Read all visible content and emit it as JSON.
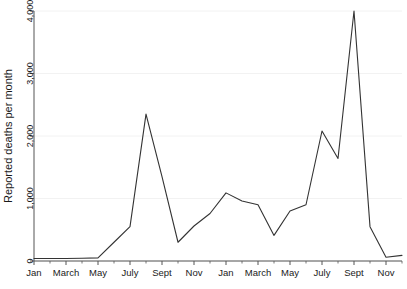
{
  "chart_data": {
    "type": "line",
    "title": "",
    "xlabel": "",
    "ylabel": "Reported deaths per month",
    "ylim": [
      0,
      4000
    ],
    "yticks": [
      0,
      1000,
      2000,
      3000,
      4000
    ],
    "ytick_labels": [
      "0",
      "1,000",
      "2,000",
      "3,000",
      "4,000"
    ],
    "grid": true,
    "grid_axis": "y",
    "legend": "none",
    "line_color": "#333333",
    "axis_color": "#555555",
    "grid_color": "#f2f2f2",
    "background_color": "#ffffff",
    "xtick_labels": [
      "Jan",
      "March",
      "May",
      "July",
      "Sept",
      "Nov",
      "Jan",
      "March",
      "May",
      "July",
      "Sept",
      "Nov"
    ],
    "xtick_indices": [
      0,
      2,
      4,
      6,
      8,
      10,
      12,
      14,
      16,
      18,
      20,
      22
    ],
    "x": [
      0,
      1,
      2,
      3,
      4,
      5,
      6,
      7,
      8,
      9,
      10,
      11,
      12,
      13,
      14,
      15,
      16,
      17,
      18,
      19,
      20,
      21,
      22,
      23
    ],
    "x_labels": [
      "Jan",
      "Feb",
      "March",
      "April",
      "May",
      "June",
      "July",
      "Aug",
      "Sept",
      "Oct",
      "Nov",
      "Dec",
      "Jan",
      "Feb",
      "March",
      "April",
      "May",
      "June",
      "July",
      "Aug",
      "Sept",
      "Oct",
      "Nov",
      "Dec"
    ],
    "values": [
      40,
      40,
      40,
      45,
      50,
      300,
      550,
      2350,
      1350,
      300,
      560,
      760,
      1090,
      960,
      900,
      410,
      800,
      900,
      2080,
      1640,
      4000,
      550,
      60,
      90
    ],
    "series": [
      {
        "name": "Reported deaths per month",
        "values": [
          40,
          40,
          40,
          45,
          50,
          300,
          550,
          2350,
          1350,
          300,
          560,
          760,
          1090,
          960,
          900,
          410,
          800,
          900,
          2080,
          1640,
          4000,
          550,
          60,
          90
        ]
      }
    ]
  }
}
